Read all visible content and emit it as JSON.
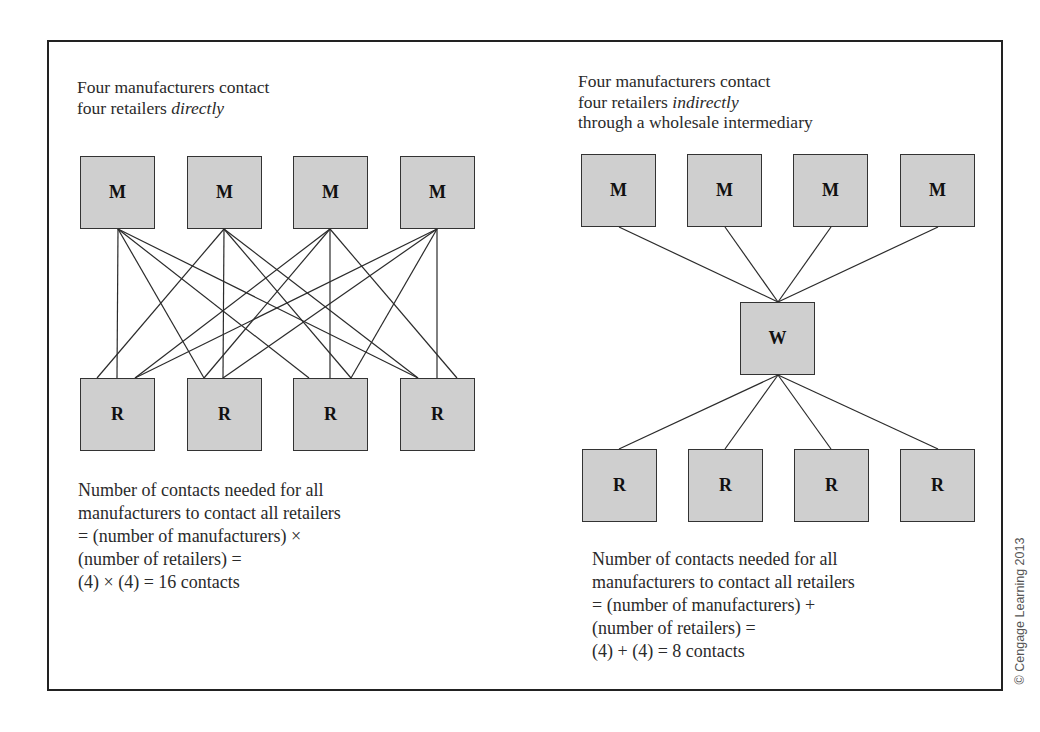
{
  "figure": {
    "credit": "© Cengage Learning 2013",
    "node_fill": "#cfcfcf",
    "border_color": "#222222"
  },
  "left_panel": {
    "title_line1": "Four manufacturers contact",
    "title_line2_prefix": "four retailers ",
    "title_line2_emphasis": "directly",
    "manufacturers": [
      {
        "label": "M",
        "x": 80,
        "y": 156
      },
      {
        "label": "M",
        "x": 187,
        "y": 156
      },
      {
        "label": "M",
        "x": 293,
        "y": 156
      },
      {
        "label": "M",
        "x": 400,
        "y": 156
      }
    ],
    "retailers": [
      {
        "label": "R",
        "x": 80,
        "y": 378
      },
      {
        "label": "R",
        "x": 187,
        "y": 378
      },
      {
        "label": "R",
        "x": 293,
        "y": 378
      },
      {
        "label": "R",
        "x": 400,
        "y": 378
      }
    ],
    "formula_lines": [
      "Number of contacts needed for all",
      "manufacturers to contact all retailers",
      "= (number of manufacturers) ×",
      "(number of retailers) =",
      "(4) × (4) = 16 contacts"
    ],
    "contacts": 16
  },
  "right_panel": {
    "title_line1": "Four manufacturers contact",
    "title_line2_prefix": "four retailers ",
    "title_line2_emphasis": "indirectly",
    "title_line3": "through a wholesale intermediary",
    "manufacturers": [
      {
        "label": "M",
        "x": 581,
        "y": 154
      },
      {
        "label": "M",
        "x": 687,
        "y": 154
      },
      {
        "label": "M",
        "x": 793,
        "y": 154
      },
      {
        "label": "M",
        "x": 900,
        "y": 154
      }
    ],
    "wholesaler": {
      "label": "W",
      "x": 740,
      "y": 302
    },
    "retailers": [
      {
        "label": "R",
        "x": 582,
        "y": 449
      },
      {
        "label": "R",
        "x": 688,
        "y": 449
      },
      {
        "label": "R",
        "x": 794,
        "y": 449
      },
      {
        "label": "R",
        "x": 900,
        "y": 449
      }
    ],
    "formula_lines": [
      "Number of contacts needed for all",
      "manufacturers to contact all retailers",
      "= (number of manufacturers) +",
      "(number of retailers) =",
      "(4) + (4) = 8 contacts"
    ],
    "contacts": 8
  }
}
